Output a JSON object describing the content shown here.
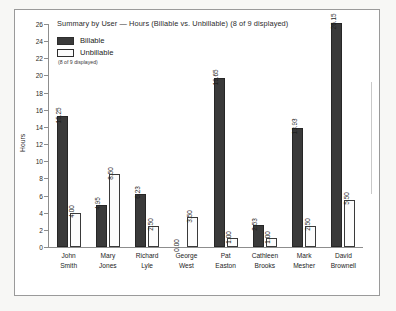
{
  "chart_data": {
    "type": "bar",
    "title": "Summary by User — Hours (Billable vs. Unbillable) (8 of 9 displayed)",
    "xlabel": "",
    "ylabel": "Hours",
    "ylim": [
      0,
      26
    ],
    "yticks": [
      0,
      2,
      4,
      6,
      8,
      10,
      12,
      14,
      16,
      18,
      20,
      22,
      24,
      26
    ],
    "grid": false,
    "legend_position": "top-left",
    "legend_note": "(8 of 9 displayed)",
    "categories": [
      "John Smith",
      "Mary Jones",
      "Richard Lyle",
      "George West",
      "Pat Easton",
      "Cathleen Brooks",
      "Mark Mesher",
      "David Brownell"
    ],
    "category_lines": [
      [
        "John",
        "Smith"
      ],
      [
        "Mary",
        "Jones"
      ],
      [
        "Richard",
        "Lyle"
      ],
      [
        "George",
        "West"
      ],
      [
        "Pat",
        "Easton"
      ],
      [
        "Cathleen",
        "Brooks"
      ],
      [
        "Mark",
        "Mesher"
      ],
      [
        "David",
        "Brownell"
      ]
    ],
    "series": [
      {
        "name": "Billable",
        "color": "#3a3a3a",
        "values": [
          15.25,
          4.95,
          6.23,
          0.0,
          19.65,
          2.53,
          13.93,
          26.15
        ],
        "labels": [
          "15.25",
          "4.95",
          "6.23",
          "0.00",
          "19.65",
          "2.53",
          "13.93",
          "26.15"
        ]
      },
      {
        "name": "Unbillable",
        "color": "#fcfcfc",
        "values": [
          4.0,
          8.5,
          2.5,
          3.5,
          1.0,
          1.0,
          2.5,
          5.5
        ],
        "labels": [
          "4.00",
          "8.50",
          "2.50",
          "3.50",
          "1.00",
          "1.00",
          "2.50",
          "5.50"
        ]
      }
    ]
  }
}
